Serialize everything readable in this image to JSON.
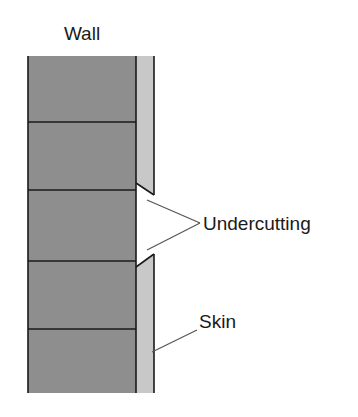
{
  "diagram": {
    "title": "Wall",
    "labels": {
      "undercutting": "Undercutting",
      "skin": "Skin"
    },
    "colors": {
      "brick": "#8e8e8e",
      "skin": "#c8c8c8",
      "line": "#1a1a1a",
      "leader": "#555555"
    },
    "mortar_lines_y": [
      122,
      190,
      261,
      329
    ]
  }
}
